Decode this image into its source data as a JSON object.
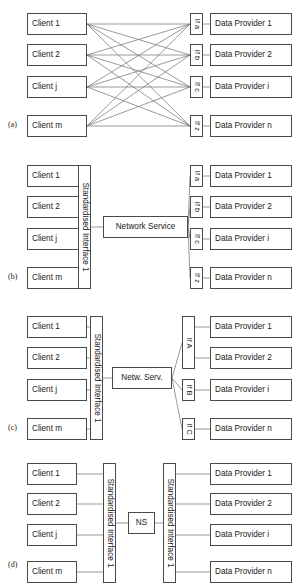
{
  "figure": {
    "line_color": "#6e6e6e",
    "box_border_color": "#4a4a4a",
    "text_color": "#1a1a1a"
  },
  "clients": [
    {
      "label": "Client 1"
    },
    {
      "label": "Client 2"
    },
    {
      "label": "Client j"
    },
    {
      "label": "Client m"
    }
  ],
  "providers": [
    {
      "label": "Data Provider 1"
    },
    {
      "label": "Data Provider 2"
    },
    {
      "label": "Data Provider i"
    },
    {
      "label": "Data Provider n"
    }
  ],
  "panels": [
    {
      "id": "a",
      "label": "(a)",
      "caption": "Direct full mesh: every client connects to every provider interface",
      "interfaces": [
        {
          "label": "If a"
        },
        {
          "label": "If b"
        },
        {
          "label": "If c"
        },
        {
          "label": "If z"
        }
      ]
    },
    {
      "id": "b",
      "label": "(b)",
      "caption": "Standardised client interface with network service hub",
      "standardised_interface": "Standardised Interface 1",
      "network_service": "Network Service",
      "interfaces": [
        {
          "label": "If a"
        },
        {
          "label": "If b"
        },
        {
          "label": "If c"
        },
        {
          "label": "If z"
        }
      ]
    },
    {
      "id": "c",
      "label": "(c)",
      "caption": "Standardised client interface, grouped provider interfaces",
      "standardised_interface": "Standardised Interface 1",
      "network_service": "Netw. Serv.",
      "interfaces": [
        {
          "label": "If A"
        },
        {
          "label": "If B"
        },
        {
          "label": "If C"
        }
      ]
    },
    {
      "id": "d",
      "label": "(d)",
      "caption": "Standardised interfaces on both sides linked by a network service",
      "standardised_interface_left": "Standardised Interface 1",
      "standardised_interface_right": "Standardised Interface 1",
      "network_service": "NS"
    }
  ]
}
